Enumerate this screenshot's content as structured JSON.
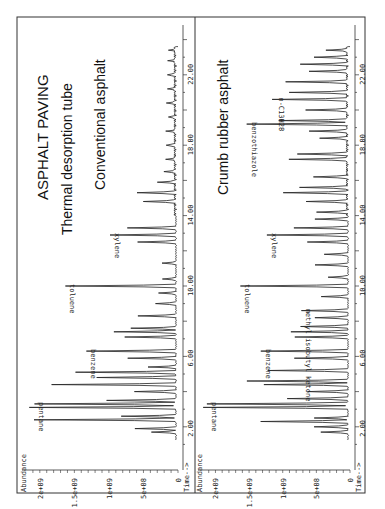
{
  "figure": {
    "title": "ASPHALT PAVING",
    "subtitle": "Thermal desorption tube",
    "orientation": "rotated 90 degrees counter-clockwise",
    "ink_color": "#222222",
    "background": "#ffffff"
  },
  "chart_data": [
    {
      "type": "line",
      "panel": "upper",
      "title": "Conventional asphalt",
      "xlabel": "Time-->",
      "ylabel": "Abundance",
      "x_ticks": [
        "2.00",
        "6.00",
        "10.00",
        "14.00",
        "18.00",
        "22.00"
      ],
      "y_ticks": [
        "0",
        "5e+08",
        "1e+09",
        "1.5e+09",
        "2e+09"
      ],
      "xlim": [
        0,
        24
      ],
      "ylim": [
        0,
        2200000000.0
      ],
      "annotations": [
        {
          "label": "pentane",
          "time": 3.3,
          "abundance": 2050000000.0
        },
        {
          "label": "benzene",
          "time": 6.3,
          "abundance": 1300000000.0
        },
        {
          "label": "toluene",
          "time": 10.0,
          "abundance": 1600000000.0
        },
        {
          "label": "xylene",
          "time": 12.9,
          "abundance": 950000000.0
        }
      ],
      "peaks": [
        {
          "t": 1.7,
          "a": 350000000.0
        },
        {
          "t": 1.9,
          "a": 600000000.0
        },
        {
          "t": 2.4,
          "a": 2050000000.0
        },
        {
          "t": 2.6,
          "a": 800000000.0
        },
        {
          "t": 3.1,
          "a": 2120000000.0
        },
        {
          "t": 3.3,
          "a": 2050000000.0
        },
        {
          "t": 3.5,
          "a": 1000000000.0
        },
        {
          "t": 4.0,
          "a": 600000000.0
        },
        {
          "t": 4.4,
          "a": 1800000000.0
        },
        {
          "t": 4.8,
          "a": 1150000000.0
        },
        {
          "t": 5.1,
          "a": 1450000000.0
        },
        {
          "t": 5.4,
          "a": 400000000.0
        },
        {
          "t": 5.9,
          "a": 700000000.0
        },
        {
          "t": 6.3,
          "a": 1300000000.0
        },
        {
          "t": 7.1,
          "a": 750000000.0
        },
        {
          "t": 7.4,
          "a": 900000000.0
        },
        {
          "t": 7.6,
          "a": 650000000.0
        },
        {
          "t": 8.3,
          "a": 550000000.0
        },
        {
          "t": 9.0,
          "a": 300000000.0
        },
        {
          "t": 9.6,
          "a": 250000000.0
        },
        {
          "t": 10.0,
          "a": 1600000000.0
        },
        {
          "t": 10.4,
          "a": 200000000.0
        },
        {
          "t": 11.3,
          "a": 200000000.0
        },
        {
          "t": 12.5,
          "a": 550000000.0
        },
        {
          "t": 12.9,
          "a": 950000000.0
        },
        {
          "t": 13.3,
          "a": 700000000.0
        },
        {
          "t": 14.8,
          "a": 450000000.0
        },
        {
          "t": 15.3,
          "a": 550000000.0
        },
        {
          "t": 15.9,
          "a": 250000000.0
        },
        {
          "t": 16.5,
          "a": 150000000.0
        },
        {
          "t": 17.2,
          "a": 120000000.0
        },
        {
          "t": 18.0,
          "a": 150000000.0
        },
        {
          "t": 18.8,
          "a": 120000000.0
        },
        {
          "t": 19.6,
          "a": 100000000.0
        },
        {
          "t": 20.4,
          "a": 120000000.0
        },
        {
          "t": 21.2,
          "a": 100000000.0
        },
        {
          "t": 22.0,
          "a": 120000000.0
        },
        {
          "t": 22.8,
          "a": 90000000.0
        },
        {
          "t": 23.4,
          "a": 80000000.0
        }
      ]
    },
    {
      "type": "line",
      "panel": "lower",
      "title": "Crumb rubber asphalt",
      "xlabel": "Time-->",
      "ylabel": "Abundance",
      "x_ticks": [
        "2.00",
        "6.00",
        "10.00",
        "14.00",
        "18.00",
        "22.00"
      ],
      "y_ticks": [
        "0",
        "5e+08",
        "1e+09",
        "1.5e+09",
        "2e+09"
      ],
      "xlim": [
        0,
        24
      ],
      "ylim": [
        0,
        2200000000.0
      ],
      "annotations": [
        {
          "label": "pentane",
          "time": 3.3,
          "abundance": 2100000000.0
        },
        {
          "label": "benzene",
          "time": 6.3,
          "abundance": 1300000000.0
        },
        {
          "label": "methyl isobutyl ketone",
          "time": 8.6,
          "abundance": 700000000.0
        },
        {
          "label": "toluene",
          "time": 10.0,
          "abundance": 1600000000.0
        },
        {
          "label": "xylene",
          "time": 12.9,
          "abundance": 1200000000.0
        },
        {
          "label": "benzothiazole",
          "time": 19.2,
          "abundance": 1500000000.0
        },
        {
          "label": "n-C13H28",
          "time": 20.6,
          "abundance": 1100000000.0
        }
      ],
      "peaks": [
        {
          "t": 1.7,
          "a": 400000000.0
        },
        {
          "t": 2.0,
          "a": 500000000.0
        },
        {
          "t": 2.3,
          "a": 1300000000.0
        },
        {
          "t": 2.5,
          "a": 500000000.0
        },
        {
          "t": 3.1,
          "a": 2150000000.0
        },
        {
          "t": 3.3,
          "a": 2100000000.0
        },
        {
          "t": 3.6,
          "a": 900000000.0
        },
        {
          "t": 4.0,
          "a": 600000000.0
        },
        {
          "t": 4.4,
          "a": 1250000000.0
        },
        {
          "t": 4.6,
          "a": 1500000000.0
        },
        {
          "t": 5.2,
          "a": 1200000000.0
        },
        {
          "t": 5.9,
          "a": 800000000.0
        },
        {
          "t": 6.3,
          "a": 1300000000.0
        },
        {
          "t": 7.1,
          "a": 800000000.0
        },
        {
          "t": 7.4,
          "a": 850000000.0
        },
        {
          "t": 7.7,
          "a": 700000000.0
        },
        {
          "t": 8.2,
          "a": 500000000.0
        },
        {
          "t": 8.6,
          "a": 700000000.0
        },
        {
          "t": 9.4,
          "a": 400000000.0
        },
        {
          "t": 10.0,
          "a": 1600000000.0
        },
        {
          "t": 10.5,
          "a": 300000000.0
        },
        {
          "t": 11.2,
          "a": 500000000.0
        },
        {
          "t": 11.8,
          "a": 350000000.0
        },
        {
          "t": 12.5,
          "a": 600000000.0
        },
        {
          "t": 12.9,
          "a": 1200000000.0
        },
        {
          "t": 13.3,
          "a": 800000000.0
        },
        {
          "t": 13.8,
          "a": 500000000.0
        },
        {
          "t": 14.2,
          "a": 450000000.0
        },
        {
          "t": 14.8,
          "a": 600000000.0
        },
        {
          "t": 15.3,
          "a": 950000000.0
        },
        {
          "t": 15.6,
          "a": 700000000.0
        },
        {
          "t": 16.2,
          "a": 500000000.0
        },
        {
          "t": 17.2,
          "a": 850000000.0
        },
        {
          "t": 17.5,
          "a": 750000000.0
        },
        {
          "t": 18.4,
          "a": 400000000.0
        },
        {
          "t": 18.8,
          "a": 550000000.0
        },
        {
          "t": 19.2,
          "a": 1500000000.0
        },
        {
          "t": 19.4,
          "a": 1000000000.0
        },
        {
          "t": 20.0,
          "a": 600000000.0
        },
        {
          "t": 20.6,
          "a": 1100000000.0
        },
        {
          "t": 21.0,
          "a": 850000000.0
        },
        {
          "t": 21.6,
          "a": 900000000.0
        },
        {
          "t": 22.2,
          "a": 550000000.0
        },
        {
          "t": 22.6,
          "a": 700000000.0
        },
        {
          "t": 23.0,
          "a": 500000000.0
        },
        {
          "t": 23.4,
          "a": 300000000.0
        }
      ]
    }
  ]
}
